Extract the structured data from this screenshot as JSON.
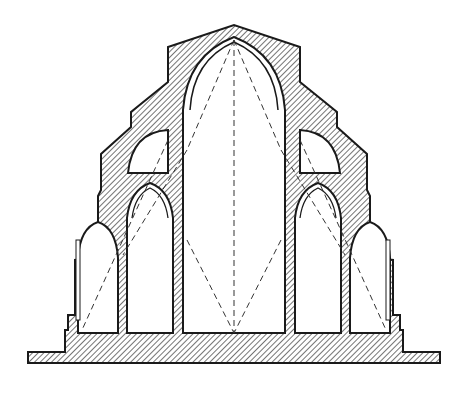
{
  "figure": {
    "type": "architectural-cross-section",
    "colors": {
      "background": "#ffffff",
      "ink": "#1a1a1a",
      "hatch": "#2a2a2a"
    },
    "elements": [
      "ground-line",
      "foundation-base",
      "nave-vault",
      "left-inner-aisle-arch",
      "right-inner-aisle-arch",
      "left-outer-aisle-arch",
      "right-outer-aisle-arch",
      "left-triforium-quarter-arch",
      "right-triforium-quarter-arch",
      "construction-dashed-lines"
    ]
  }
}
